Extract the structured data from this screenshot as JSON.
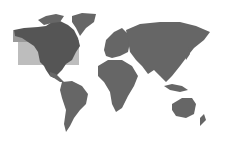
{
  "map": {
    "type": "world-map",
    "style": "grayscale",
    "colors": {
      "background": "#ffffff",
      "land": "#666666",
      "highlight_region_fill": "#bdbdbd",
      "highlighted_land": "#474747"
    },
    "highlight": {
      "label": "North America region",
      "x": 18,
      "y": 40,
      "width": 61,
      "height": 25
    },
    "continents": [
      "North America",
      "Greenland",
      "South America",
      "Europe",
      "Africa",
      "Asia",
      "Australia",
      "New Zealand"
    ]
  }
}
